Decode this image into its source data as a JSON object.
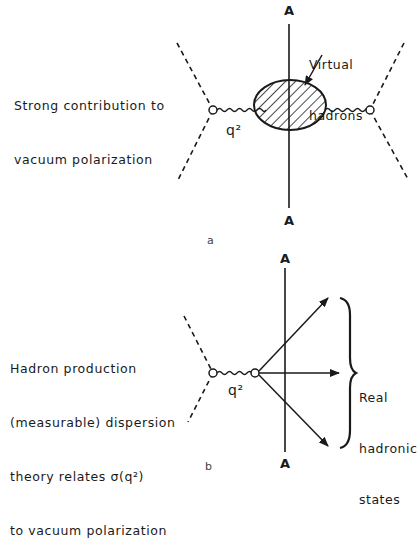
{
  "panel_a": {
    "panel_label": "a",
    "caption_line1": "Strong contribution to",
    "caption_line2": "vacuum polarization",
    "cut_label_top": "A",
    "cut_label_bottom": "A",
    "blob_label_line1": "Virtual",
    "blob_label_line2": "hadrons",
    "propagator_label": "q²"
  },
  "panel_b": {
    "panel_label": "b",
    "caption_line1": "Hadron production",
    "caption_line2": "(measurable) dispersion",
    "caption_line3": "theory relates σ(q²)",
    "caption_line4": "to vacuum polarization",
    "cut_label_top": "A",
    "cut_label_bottom": "A",
    "propagator_label": "q²",
    "states_label_line1": "Real",
    "states_label_line2": "hadronic",
    "states_label_line3": "states"
  }
}
